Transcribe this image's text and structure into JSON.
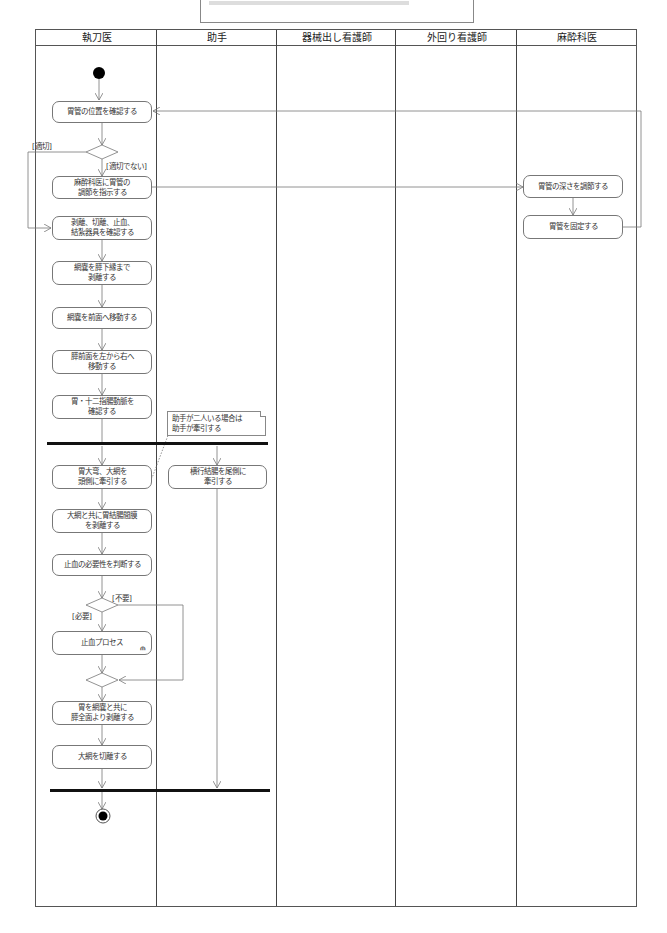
{
  "top_note": {
    "text": ""
  },
  "lanes": [
    {
      "label": "執刀医"
    },
    {
      "label": "助手"
    },
    {
      "label": "器械出し看護師"
    },
    {
      "label": "外回り看護師"
    },
    {
      "label": "麻酔科医"
    }
  ],
  "actions": {
    "surgeon": [
      {
        "label": "胃管の位置を確認する"
      },
      {
        "label": "麻酔科医に胃管の\n調節を指示する"
      },
      {
        "label": "剥離、切離、止血、\n結紮器具を確認する"
      },
      {
        "label": "網嚢を膵下縁まで\n剥離する"
      },
      {
        "label": "網嚢を前面へ移動する"
      },
      {
        "label": "膵前面を左から右へ\n移動する"
      },
      {
        "label": "胃・十二指腸動脈を\n確認する"
      },
      {
        "label": "胃大弯、大網を\n頭側に牽引する"
      },
      {
        "label": "大網と共に胃結腸間膜\nを剥離する"
      },
      {
        "label": "止血の必要性を判断する"
      },
      {
        "label": "止血プロセス"
      },
      {
        "label": "胃を網嚢と共に\n膵全面より剥離する"
      },
      {
        "label": "大網を切離する"
      }
    ],
    "assistant": [
      {
        "label": "横行結腸を尾側に\n牽引する"
      }
    ],
    "anesthesiologist": [
      {
        "label": "胃管の深さを調節する"
      },
      {
        "label": "胃管を固定する"
      }
    ]
  },
  "guards": {
    "appropriate": "[適切]",
    "not_appropriate": "[適切でない]",
    "unnecessary": "[不要]",
    "necessary": "[必要]"
  },
  "note": {
    "text": "助手が二人いる場合は\n助手が牽引する"
  },
  "icons": {
    "start": "initial-node",
    "end": "final-node",
    "subactivity": "rake-icon"
  }
}
